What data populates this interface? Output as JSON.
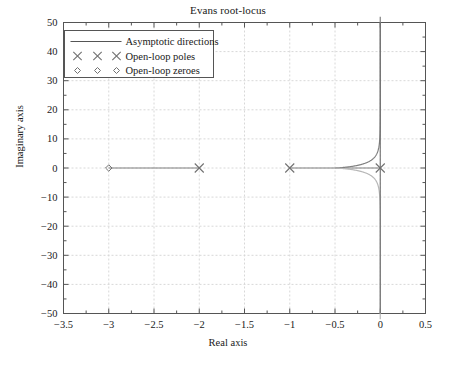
{
  "chart_data": {
    "type": "line",
    "title": "Evans root-locus",
    "xlabel": "Real axis",
    "ylabel": "Imaginary axis",
    "xlim": [
      -3.5,
      0.5
    ],
    "ylim": [
      -50,
      50
    ],
    "xticks": [
      -3.5,
      -3,
      -2.5,
      -2,
      -1.5,
      -1,
      -0.5,
      0,
      0.5
    ],
    "xticklabels": [
      "−3.5",
      "−3",
      "−2.5",
      "−2",
      "−1.5",
      "−1",
      "−0.5",
      "0",
      "0.5"
    ],
    "yticks": [
      -50,
      -40,
      -30,
      -20,
      -10,
      0,
      10,
      20,
      30,
      40,
      50
    ],
    "yticklabels": [
      "−50",
      "−40",
      "−30",
      "−20",
      "−10",
      "0",
      "10",
      "20",
      "30",
      "40",
      "50"
    ],
    "grid": true,
    "grid_style": "dashed",
    "grid_color": "#d8d8d8",
    "frame_color": "#555555",
    "legend_position": "upper left",
    "legend": [
      {
        "label": "Asymptotic directions",
        "marker": "line"
      },
      {
        "label": "Open-loop poles",
        "marker": "x"
      },
      {
        "label": "Open-loop zeroes",
        "marker": "diamond"
      }
    ],
    "open_loop_poles": [
      {
        "re": -2,
        "im": 0
      },
      {
        "re": -1,
        "im": 0
      },
      {
        "re": 0,
        "im": 0
      }
    ],
    "open_loop_zeroes": [
      {
        "re": -3,
        "im": 0
      }
    ],
    "asymptote_lines": [
      {
        "from": {
          "re": 0,
          "im": -50
        },
        "to": {
          "re": 0,
          "im": 50
        }
      }
    ],
    "breakaway_point": {
      "re": -0.5,
      "im": 0
    },
    "branch_colors": {
      "primary": "#808080",
      "secondary": "#b8b8b8"
    },
    "segments": [
      {
        "name": "real-axis-locus-zero-to-pole",
        "from": {
          "re": -3,
          "im": 0
        },
        "to": {
          "re": -2,
          "im": 0
        }
      },
      {
        "name": "real-axis-locus-pole-to-breakaway",
        "from": {
          "re": -1,
          "im": 0
        },
        "to": {
          "re": -0.5,
          "im": 0
        }
      },
      {
        "name": "real-axis-locus-breakaway-to-origin",
        "from": {
          "re": -0.5,
          "im": 0
        },
        "to": {
          "re": 0,
          "im": 0
        }
      }
    ]
  }
}
